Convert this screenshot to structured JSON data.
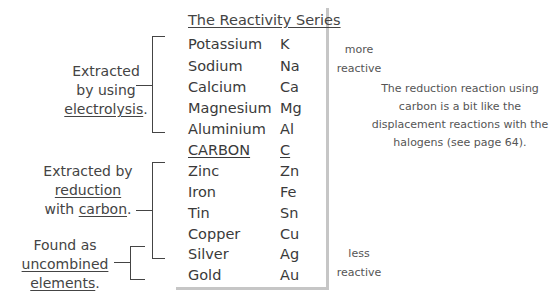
{
  "table": {
    "title": "The Reactivity Series",
    "rows": [
      {
        "name": "Potassium",
        "symbol": "K"
      },
      {
        "name": "Sodium",
        "symbol": "Na"
      },
      {
        "name": "Calcium",
        "symbol": "Ca"
      },
      {
        "name": "Magnesium",
        "symbol": "Mg"
      },
      {
        "name": "Aluminium",
        "symbol": "Al"
      },
      {
        "name": "CARBON",
        "symbol": "C"
      },
      {
        "name": "Zinc",
        "symbol": "Zn"
      },
      {
        "name": "Iron",
        "symbol": "Fe"
      },
      {
        "name": "Tin",
        "symbol": "Sn"
      },
      {
        "name": "Copper",
        "symbol": "Cu"
      },
      {
        "name": "Silver",
        "symbol": "Ag"
      },
      {
        "name": "Gold",
        "symbol": "Au"
      }
    ]
  },
  "groups": {
    "electrolysis": {
      "line1": "Extracted",
      "line2": "by using",
      "line3": "electrolysis",
      "punct": "."
    },
    "reduction": {
      "line1": "Extracted by",
      "line2": "reduction",
      "line3a": "with ",
      "line3b": "carbon",
      "punct": "."
    },
    "uncombined": {
      "line1": "Found as",
      "line2": "uncombined",
      "line3": "elements",
      "punct": "."
    }
  },
  "scale": {
    "top_line1": "more",
    "top_line2": "reactive",
    "bottom_line1": "less",
    "bottom_line2": "reactive"
  },
  "note": "The reduction reaction using carbon is a bit like the displacement reactions with the halogens (see page 64)."
}
